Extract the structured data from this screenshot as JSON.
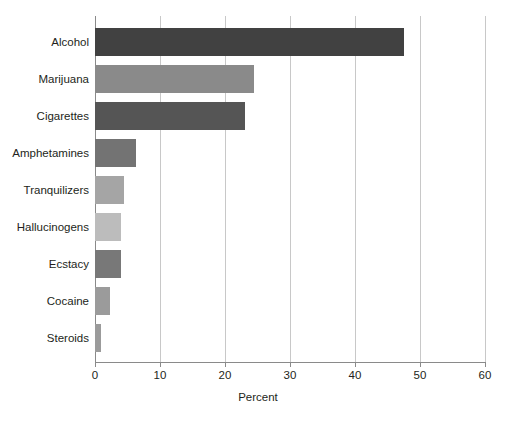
{
  "chart_data": {
    "type": "bar",
    "orientation": "horizontal",
    "title": "",
    "subtitle": "",
    "xlabel": "Percent",
    "ylabel": "",
    "xlim": [
      0,
      60
    ],
    "xticks": [
      0,
      10,
      20,
      30,
      40,
      50,
      60
    ],
    "xtick_labels": [
      "0",
      "10",
      "20",
      "30",
      "40",
      "50",
      "60"
    ],
    "grid": "vertical",
    "legend": "none",
    "categories": [
      "Alcohol",
      "Marijuana",
      "Cigarettes",
      "Amphetamines",
      "Tranquilizers",
      "Hallucinogens",
      "Ecstacy",
      "Cocaine",
      "Steroids"
    ],
    "values": [
      47.5,
      24.5,
      23.0,
      6.3,
      4.4,
      4.0,
      4.0,
      2.3,
      0.9
    ],
    "bar_colors": [
      "#414141",
      "#8a8a8a",
      "#555555",
      "#737373",
      "#a5a5a5",
      "#bcbcbc",
      "#787878",
      "#9b9b9b",
      "#9b9b9b"
    ],
    "colors": {
      "background": "#ffffff",
      "gridline": "#c8c8c8",
      "axis": "#8a8a8a",
      "text": "#231f20"
    },
    "bars": [
      {
        "label": "Alcohol",
        "value": 47.5,
        "color": "#414141"
      },
      {
        "label": "Marijuana",
        "value": 24.5,
        "color": "#8a8a8a"
      },
      {
        "label": "Cigarettes",
        "value": 23.0,
        "color": "#555555"
      },
      {
        "label": "Amphetamines",
        "value": 6.3,
        "color": "#737373"
      },
      {
        "label": "Tranquilizers",
        "value": 4.4,
        "color": "#a5a5a5"
      },
      {
        "label": "Hallucinogens",
        "value": 4.0,
        "color": "#bcbcbc"
      },
      {
        "label": "Ecstacy",
        "value": 4.0,
        "color": "#787878"
      },
      {
        "label": "Cocaine",
        "value": 2.3,
        "color": "#9b9b9b"
      },
      {
        "label": "Steroids",
        "value": 0.9,
        "color": "#9b9b9b"
      }
    ]
  }
}
